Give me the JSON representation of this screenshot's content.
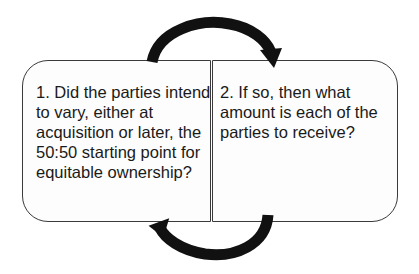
{
  "diagram": {
    "steps": [
      {
        "label": "1. Did the parties intend to vary, either at acquisition or later, the 50:50 starting point for equitable ownership?"
      },
      {
        "label": "2. If so, then what amount is each of the parties to receive?"
      }
    ],
    "arrows": [
      {
        "from": "step-1",
        "to": "step-2",
        "position": "top"
      },
      {
        "from": "step-2",
        "to": "step-1",
        "position": "bottom"
      }
    ],
    "colors": {
      "stroke": "#3a3a3a",
      "arrow": "#111111",
      "text": "#1a1a1a",
      "background": "#ffffff"
    }
  }
}
